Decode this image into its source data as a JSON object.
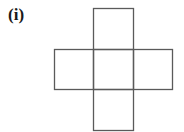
{
  "figure": {
    "label": "(i)",
    "stroke_color": "#5a5a5a",
    "squares": [
      {
        "name": "top",
        "x": 93,
        "y": 8,
        "w": 40,
        "h": 41
      },
      {
        "name": "left",
        "x": 54,
        "y": 49,
        "w": 39,
        "h": 40
      },
      {
        "name": "center",
        "x": 93,
        "y": 49,
        "w": 40,
        "h": 40
      },
      {
        "name": "right",
        "x": 133,
        "y": 49,
        "w": 39,
        "h": 40
      },
      {
        "name": "bottom",
        "x": 93,
        "y": 89,
        "w": 40,
        "h": 41
      }
    ]
  }
}
